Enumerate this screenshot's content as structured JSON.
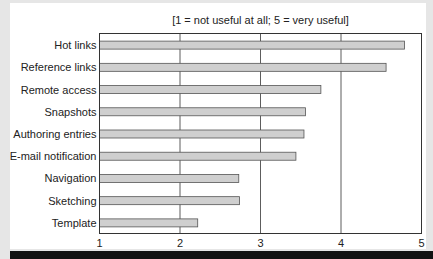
{
  "chart_data": {
    "type": "bar",
    "orientation": "horizontal",
    "title": "[1 = not useful at all; 5 = very useful]",
    "xlabel": "",
    "ylabel": "",
    "categories": [
      "Hot links",
      "Reference links",
      "Remote access",
      "Snapshots",
      "Authoring entries",
      "E-mail notification",
      "Navigation",
      "Sketching",
      "Template"
    ],
    "values": [
      4.79,
      4.56,
      3.75,
      3.56,
      3.54,
      3.44,
      2.73,
      2.74,
      2.22
    ],
    "xlim": [
      1,
      5
    ],
    "xticks": [
      "1",
      "2",
      "3",
      "4",
      "5"
    ],
    "grid": true,
    "legend": "none",
    "colors": {
      "bar": "#cfcfcf",
      "bar_stroke": "#555555",
      "grid": "#333333"
    }
  }
}
